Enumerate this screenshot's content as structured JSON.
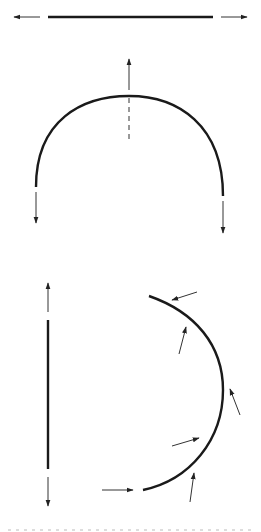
{
  "diagram": {
    "title": "",
    "colors": {
      "line": "#1a1a1a",
      "arrow": "#333333",
      "background": "#ffffff"
    },
    "figures": [
      {
        "id": "straight-horizontal",
        "description": "Horizontal straight segment with outward arrows at both ends",
        "segment": {
          "x1": 48,
          "y1": 17,
          "x2": 213,
          "y2": 17
        },
        "arrows": [
          {
            "from": [
              40,
              17
            ],
            "to": [
              14,
              17
            ]
          },
          {
            "from": [
              221,
              17
            ],
            "to": [
              247,
              17
            ]
          }
        ]
      },
      {
        "id": "semicircular-arch",
        "description": "Semicircular arch with vertical arrows: upward at crown (with dashed axis), downward at both ends",
        "arc": {
          "start": [
            36,
            187
          ],
          "apex": [
            129,
            96
          ],
          "end": [
            223,
            196
          ]
        },
        "dashed_axis": {
          "x": 129,
          "y1": 97,
          "y2": 142
        },
        "arrows": [
          {
            "from": [
              129,
              90
            ],
            "to": [
              129,
              59
            ]
          },
          {
            "from": [
              36,
              192
            ],
            "to": [
              36,
              223
            ]
          },
          {
            "from": [
              223,
              201
            ],
            "to": [
              223,
              233
            ]
          }
        ]
      },
      {
        "id": "straight-vertical",
        "description": "Vertical straight segment with outward arrows at both ends",
        "segment": {
          "x1": 48,
          "y1": 320,
          "x2": 48,
          "y2": 469
        },
        "arrows": [
          {
            "from": [
              48,
              312
            ],
            "to": [
              48,
              283
            ]
          },
          {
            "from": [
              48,
              477
            ],
            "to": [
              48,
              506
            ]
          }
        ]
      },
      {
        "id": "curved-arc-forces",
        "description": "Arc (D-shape) with several force arrows acting at angles along it",
        "arc": {
          "start": [
            149,
            296
          ],
          "mid": [
            223,
            390
          ],
          "end": [
            143,
            490
          ]
        },
        "arrows": [
          {
            "from": [
              197,
              292
            ],
            "to": [
              172,
              300
            ]
          },
          {
            "from": [
              179,
              354
            ],
            "to": [
              186,
              327
            ]
          },
          {
            "from": [
              240,
              415
            ],
            "to": [
              230,
              389
            ]
          },
          {
            "from": [
              172,
              446
            ],
            "to": [
              199,
              438
            ]
          },
          {
            "from": [
              190,
              502
            ],
            "to": [
              194,
              473
            ]
          },
          {
            "from": [
              102,
              490
            ],
            "to": [
              133,
              490
            ]
          }
        ]
      }
    ]
  }
}
